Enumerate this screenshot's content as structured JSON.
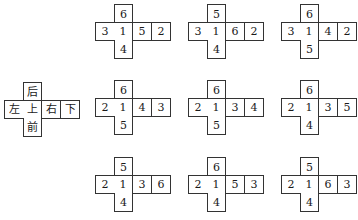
{
  "legend": {
    "top": "后",
    "row": [
      "左",
      "上",
      "右",
      "下"
    ],
    "bottom": "前"
  },
  "nets": [
    {
      "top": "6",
      "row": [
        "3",
        "1",
        "5",
        "2"
      ],
      "bottom": "4"
    },
    {
      "top": "5",
      "row": [
        "3",
        "1",
        "6",
        "2"
      ],
      "bottom": "4"
    },
    {
      "top": "6",
      "row": [
        "3",
        "1",
        "4",
        "2"
      ],
      "bottom": "5"
    },
    {
      "top": "6",
      "row": [
        "2",
        "1",
        "4",
        "3"
      ],
      "bottom": "5"
    },
    {
      "top": "6",
      "row": [
        "2",
        "1",
        "3",
        "4"
      ],
      "bottom": "5"
    },
    {
      "top": "6",
      "row": [
        "2",
        "1",
        "3",
        "5"
      ],
      "bottom": "4"
    },
    {
      "top": "5",
      "row": [
        "2",
        "1",
        "3",
        "6"
      ],
      "bottom": "4"
    },
    {
      "top": "6",
      "row": [
        "2",
        "1",
        "5",
        "3"
      ],
      "bottom": "4"
    },
    {
      "top": "5",
      "row": [
        "2",
        "1",
        "6",
        "3"
      ],
      "bottom": "4"
    }
  ]
}
